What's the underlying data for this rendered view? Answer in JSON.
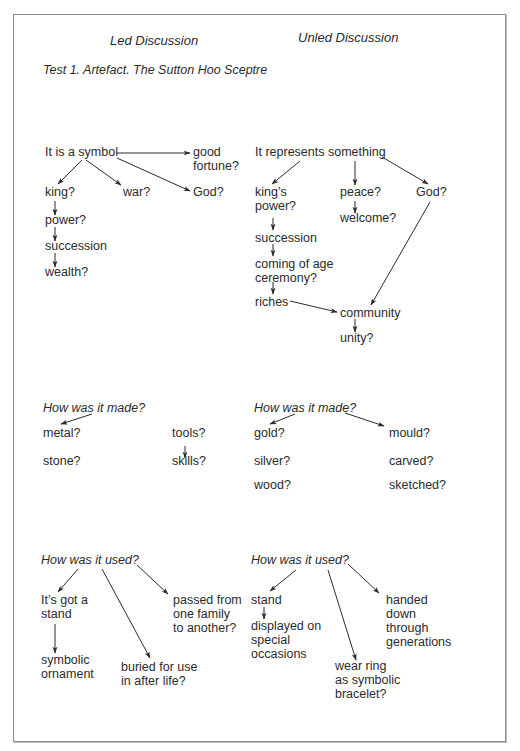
{
  "headers": {
    "led": "Led Discussion",
    "unled": "Unled Discussion",
    "test_title": "Test 1. Artefact. The Sutton Hoo Sceptre"
  },
  "led": {
    "meaning": {
      "root": "It is a symbol",
      "good_fortune": "good\nfortune?",
      "king": "king?",
      "war": "war?",
      "god": "God?",
      "power": "power?",
      "succession": "succession",
      "wealth": "wealth?"
    },
    "made": {
      "question": "How was it made?",
      "metal": "metal?",
      "stone": "stone?",
      "tools": "tools?",
      "skills": "skills?"
    },
    "used": {
      "question": "How was it used?",
      "stand": "It’s got a\nstand",
      "ornament": "symbolic\nornament",
      "buried": "buried for use\nin after life?",
      "passed": "passed from\none family\nto another?"
    }
  },
  "unled": {
    "meaning": {
      "root": "It represents something",
      "kings_power": "king’s\npower?",
      "peace": "peace?",
      "god": "God?",
      "welcome": "welcome?",
      "succession": "succession",
      "coming_of_age": "coming of age\nceremony?",
      "riches": "riches",
      "community": "community",
      "unity": "unity?"
    },
    "made": {
      "question": "How was it made?",
      "gold": "gold?",
      "silver": "silver?",
      "wood": "wood?",
      "mould": "mould?",
      "carved": "carved?",
      "sketched": "sketched?"
    },
    "used": {
      "question": "How was it used?",
      "stand": "stand",
      "displayed": "displayed on\nspecial\noccasions",
      "wear_ring": "wear ring\nas symbolic\nbracelet?",
      "handed_down": "handed\ndown\nthrough\ngenerations"
    }
  },
  "colors": {
    "text": "#2b2b2b",
    "border": "#8a8a8a",
    "arrow": "#2b2b2b"
  }
}
